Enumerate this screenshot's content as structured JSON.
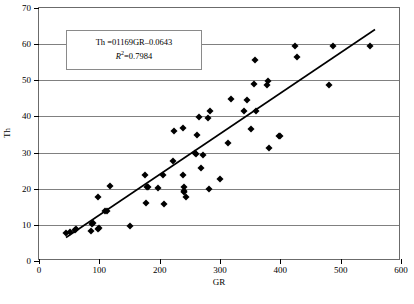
{
  "chart_data": {
    "type": "scatter",
    "title": "",
    "xlabel": "GR",
    "ylabel": "Th",
    "xlim": [
      0,
      600
    ],
    "ylim": [
      0,
      70
    ],
    "xticks": [
      0,
      100,
      200,
      300,
      400,
      500,
      600
    ],
    "yticks": [
      0,
      10,
      20,
      30,
      40,
      50,
      60,
      70
    ],
    "grid": "horizontal",
    "legend": "none",
    "marker": "black-diamond",
    "annotations": {
      "equation": "Th =01169GR–0.0643",
      "r_squared_label": "R",
      "r_squared_exponent": "2",
      "r_squared_value": "=0.7984"
    },
    "trendline": {
      "type": "linear",
      "slope": 0.1169,
      "intercept": -0.0643,
      "x_start": 45,
      "y_start": 6.0,
      "x_end": 560,
      "y_end": 64.0
    },
    "points": [
      [
        45,
        7.8
      ],
      [
        52,
        7.9
      ],
      [
        60,
        8.6
      ],
      [
        62,
        8.9
      ],
      [
        86,
        8.3
      ],
      [
        88,
        10.2
      ],
      [
        90,
        10.4
      ],
      [
        97,
        8.9
      ],
      [
        99,
        9.0
      ],
      [
        98,
        17.6
      ],
      [
        110,
        13.7
      ],
      [
        112,
        13.9
      ],
      [
        118,
        20.8
      ],
      [
        150,
        9.8
      ],
      [
        176,
        23.8
      ],
      [
        178,
        16.0
      ],
      [
        179,
        20.4
      ],
      [
        181,
        20.5
      ],
      [
        198,
        20.3
      ],
      [
        205,
        23.9
      ],
      [
        208,
        15.8
      ],
      [
        222,
        27.8
      ],
      [
        224,
        36.1
      ],
      [
        238,
        36.8
      ],
      [
        239,
        23.9
      ],
      [
        240,
        20.5
      ],
      [
        241,
        19.3
      ],
      [
        240,
        19.0
      ],
      [
        243,
        17.6
      ],
      [
        259,
        29.8
      ],
      [
        261,
        29.6
      ],
      [
        262,
        34.9
      ],
      [
        266,
        39.8
      ],
      [
        268,
        25.8
      ],
      [
        272,
        29.4
      ],
      [
        280,
        39.7
      ],
      [
        283,
        41.4
      ],
      [
        281,
        19.8
      ],
      [
        300,
        22.7
      ],
      [
        314,
        32.6
      ],
      [
        318,
        44.7
      ],
      [
        340,
        41.6
      ],
      [
        344,
        44.6
      ],
      [
        352,
        36.4
      ],
      [
        356,
        48.9
      ],
      [
        358,
        55.7
      ],
      [
        360,
        41.5
      ],
      [
        378,
        48.7
      ],
      [
        380,
        49.9
      ],
      [
        382,
        31.4
      ],
      [
        398,
        34.6
      ],
      [
        400,
        34.7
      ],
      [
        425,
        59.5
      ],
      [
        427,
        56.4
      ],
      [
        480,
        48.8
      ],
      [
        488,
        59.6
      ],
      [
        548,
        59.6
      ]
    ]
  },
  "caption": ""
}
